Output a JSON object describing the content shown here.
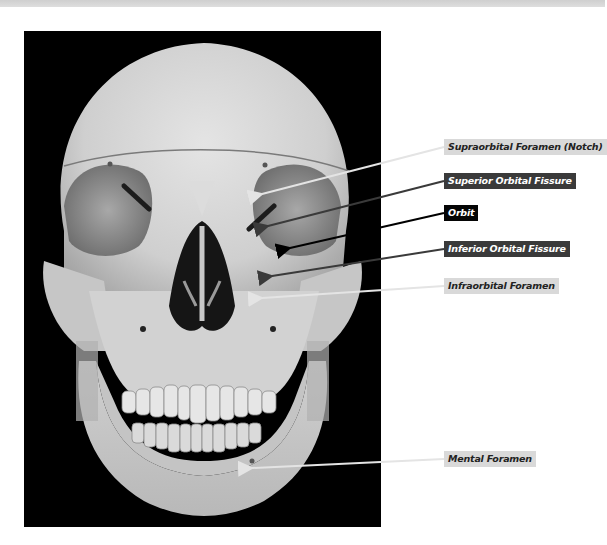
{
  "figure": {
    "colors": {
      "background": "#ffffff",
      "photo_background": "#000000",
      "top_bar": "#d8d8d8",
      "light_label_bg": "#d9d9d9",
      "dark_label_bg": "#3a3a3a",
      "black_label_bg": "#050505",
      "light_arrow": "#e0e0e0",
      "dark_arrow": "#3a3a3a",
      "black_arrow": "#000000"
    }
  },
  "labels": [
    {
      "id": "supraorbital",
      "text": "Supraorbital Foramen (Notch)",
      "style": "light"
    },
    {
      "id": "superior-orbital-fissure",
      "text": "Superior Orbital Fissure",
      "style": "dark"
    },
    {
      "id": "orbit",
      "text": "Orbit",
      "style": "black"
    },
    {
      "id": "inferior-orbital-fissure",
      "text": "Inferior Orbital Fissure",
      "style": "dark"
    },
    {
      "id": "infraorbital",
      "text": "Infraorbital Foramen",
      "style": "light"
    },
    {
      "id": "mental",
      "text": "Mental Foramen",
      "style": "light"
    }
  ]
}
